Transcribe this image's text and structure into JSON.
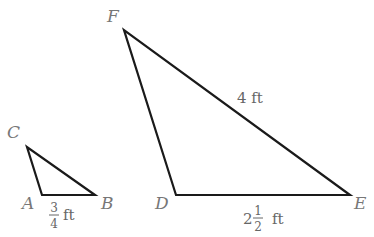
{
  "diagram": {
    "type": "similar-triangles",
    "triangles": [
      {
        "name": "small-triangle-ABC",
        "vertices": {
          "A": {
            "label": "A",
            "x": 42,
            "y": 195
          },
          "B": {
            "label": "B",
            "x": 95,
            "y": 195
          },
          "C": {
            "label": "C",
            "x": 27,
            "y": 147
          }
        },
        "measurements": [
          {
            "side": "AB",
            "whole": "",
            "numerator": "3",
            "denominator": "4",
            "unit": "ft"
          }
        ]
      },
      {
        "name": "large-triangle-DEF",
        "vertices": {
          "D": {
            "label": "D",
            "x": 176,
            "y": 195
          },
          "E": {
            "label": "E",
            "x": 350,
            "y": 195
          },
          "F": {
            "label": "F",
            "x": 124,
            "y": 30
          }
        },
        "measurements": [
          {
            "side": "FE",
            "text": "4 ft"
          },
          {
            "side": "DE",
            "whole": "2",
            "numerator": "1",
            "denominator": "2",
            "unit": "ft"
          }
        ]
      }
    ]
  },
  "colors": {
    "line": "#1a1a1a",
    "label": "#777777",
    "background": "#ffffff"
  }
}
